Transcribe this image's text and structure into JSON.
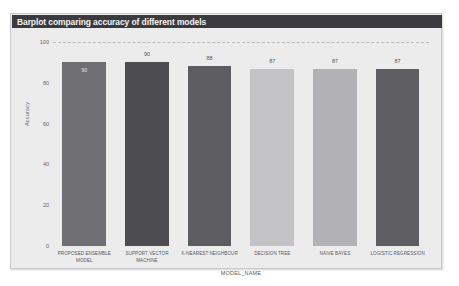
{
  "figure": {
    "title": "Barplot comparing accuracy of different models",
    "background_color": "#ececed",
    "title_bar_color": "#3a3a3f"
  },
  "chart_data": {
    "type": "bar",
    "title": "Barplot comparing accuracy of different models",
    "xlabel": "MODEL_NAME",
    "ylabel": "Accuracy",
    "ylim": [
      0,
      100
    ],
    "yticks": [
      "0",
      "20",
      "40",
      "60",
      "80",
      "100"
    ],
    "grid": true,
    "legend": "none",
    "categories": [
      "PROPOSED ENSEMBLE MODEL",
      "SUPPORT VECTOR MACHINE",
      "K-NEAREST NEIGHBOUR",
      "DECISION TREE",
      "NAIVE BAYES",
      "LOGISTIC REGRESSION"
    ],
    "values": [
      90,
      90,
      88,
      87,
      87,
      87
    ],
    "value_labels": [
      "90",
      "90",
      "88",
      "87",
      "87",
      "87"
    ],
    "bar_colors": [
      "#6e6e73",
      "#4c4c51",
      "#5c5c61",
      "#c3c3c6",
      "#b2b2b6",
      "#5e5e63"
    ]
  }
}
